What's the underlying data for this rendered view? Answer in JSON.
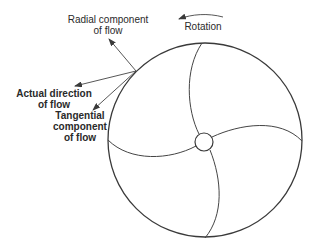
{
  "figure": {
    "type": "impeller-flow-diagram",
    "line_color": "#3a3a3a",
    "labels": {
      "radial": [
        "Radial component",
        "of flow"
      ],
      "actual": [
        "Actual direction",
        "of flow"
      ],
      "tangential": [
        "Tangential",
        "component",
        "of flow"
      ],
      "rotation": "Rotation"
    },
    "icons": {
      "rotation_arrow": "counterclockwise-arrow-icon",
      "radial_arrow": "arrow-icon",
      "actual_arrow": "arrow-icon",
      "tangential_arrow": "arrow-icon"
    },
    "geometry": {
      "outer_circle": {
        "cx": 205,
        "cy": 140,
        "r": 97
      },
      "hub": {
        "cx": 204,
        "cy": 142,
        "r": 9
      },
      "blade_count": 4,
      "vector_origin": {
        "x": 136,
        "y": 71
      }
    }
  }
}
